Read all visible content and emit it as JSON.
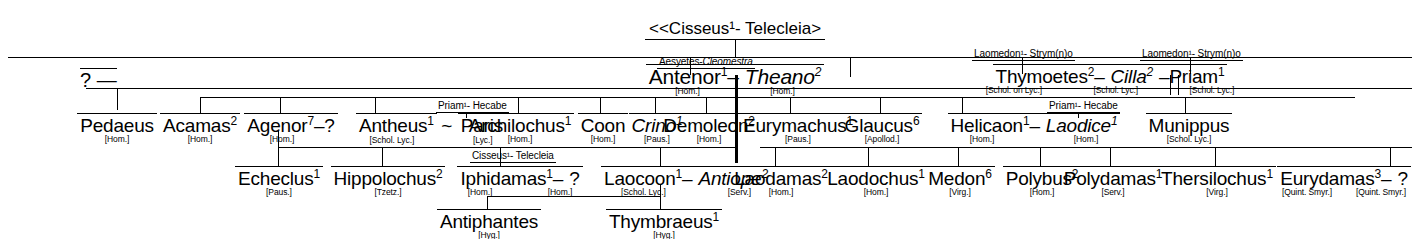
{
  "root": {
    "label": "<<Cisseus¹- Telecleia>",
    "name": "Cisseus",
    "name_sup": "1",
    "spouse": "Telecleia",
    "prefix": "<<",
    "suffix": ">"
  },
  "unknown_left": {
    "label": "? —"
  },
  "generation_2": [
    {
      "id": "antenor",
      "parents": "Aesyetes- Cleomestra",
      "parents_plain": "Aesyetes",
      "parents_spouse": "Cleomestra",
      "name": "Antenor",
      "sup": "1",
      "src": "[Hom.]",
      "link": "–",
      "spouse": "Theano",
      "spouse_sup": "2",
      "spouse_src": "[Hom.]"
    },
    {
      "id": "thymoetes",
      "parents": "Laomedon¹- Strym(n)o",
      "name": "Thymoetes",
      "sup": "2",
      "src": "[Schol. on Lyc.]",
      "link": "–",
      "spouse": "Cilla",
      "spouse_sup": "2",
      "spouse_src": "[Schol. Lyc.]"
    },
    {
      "id": "priam",
      "parents": "Laomedon¹- Strym(n)o",
      "name": "Priam",
      "sup": "1",
      "src": "[Schol. Lyc.]",
      "link": "–"
    }
  ],
  "generation_3": [
    {
      "name": "Pedaeus",
      "sup": "",
      "src": "[Hom.]"
    },
    {
      "name": "Acamas",
      "sup": "2",
      "src": "[Hom.]"
    },
    {
      "name": "Agenor",
      "sup": "7",
      "src": "[Hom.]",
      "link": "–",
      "spouse": "?"
    },
    {
      "name": "Antheus",
      "sup": "1",
      "src": "[Schol. Lyc.]",
      "link": "~",
      "spouse": "Paris",
      "spouse_src": "[Lyc.]",
      "spouse_parents": "Priam¹- Hecabe"
    },
    {
      "name": "Archilochus",
      "sup": "1",
      "src": "[Hom.]"
    },
    {
      "name": "Coon",
      "sup": "",
      "src": "[Hom.]"
    },
    {
      "name": "Crino",
      "sup": "1",
      "src": "[Paus.]",
      "italic": true
    },
    {
      "name": "Demoleon",
      "sup": "2",
      "src": "[Hom.]"
    },
    {
      "name": "Eurymachus",
      "sup": "1",
      "src": "[Paus.]"
    },
    {
      "name": "Glaucus",
      "sup": "6",
      "src": "[Apollod.]"
    },
    {
      "name": "Helicaon",
      "sup": "1",
      "src": "[Hom.]",
      "link": "–",
      "spouse": "Laodice",
      "spouse_sup": "1",
      "spouse_src": "[Hom.]",
      "spouse_parents": "Priam¹- Hecabe"
    },
    {
      "name": "Munippus",
      "sup": "",
      "src": "[Schol. Lyc.]"
    }
  ],
  "generation_4": [
    {
      "name": "Echeclus",
      "sup": "1",
      "src": "[Paus.]"
    },
    {
      "name": "Hippolochus",
      "sup": "2",
      "src": "[Tzetz.]"
    },
    {
      "name": "Iphidamas",
      "sup": "1",
      "src": "[Hom.]",
      "link": "–",
      "spouse": "?",
      "spouse_src": "[Hom.]",
      "spouse_parents": "Cisseus¹- Telecleia"
    },
    {
      "name": "Laocoon",
      "sup": "1",
      "src": "[Schol. Lyc.]",
      "link": "–",
      "spouse": "Antiope",
      "spouse_sup": "2",
      "spouse_src": "[Serv.]",
      "spouse_italic": true
    },
    {
      "name": "Laodamas",
      "sup": "2",
      "src": "[Hom.]"
    },
    {
      "name": "Laodochus",
      "sup": "1",
      "src": "[Hom.]"
    },
    {
      "name": "Medon",
      "sup": "6",
      "src": "[Virg.]"
    },
    {
      "name": "Polybus",
      "sup": "2",
      "src": "[Hom.]"
    },
    {
      "name": "Polydamas",
      "sup": "1",
      "src": "[Serv.]"
    },
    {
      "name": "Thersilochus",
      "sup": "1",
      "src": "[Virg.]"
    },
    {
      "name": "Eurydamas",
      "sup": "3",
      "src": "[Quint. Smyr.]",
      "link": "–",
      "spouse": "?",
      "spouse_src": "[Quint. Smyr.]"
    }
  ],
  "generation_5": [
    {
      "name": "Antiphantes",
      "sup": "",
      "src": "[Hyg.]"
    },
    {
      "name": "Thymbraeus",
      "sup": "1",
      "src": "[Hyg.]"
    }
  ]
}
